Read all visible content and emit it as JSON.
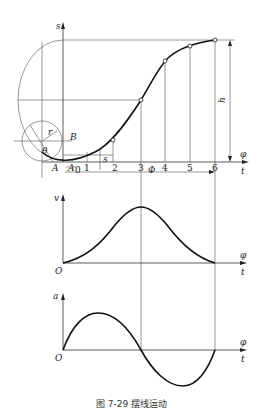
{
  "caption": "图 7-29   摆线运动",
  "labels": {
    "s_axis": "s",
    "v_axis": "v",
    "a_axis": "a",
    "phi": "φ",
    "t": "t",
    "h": "h",
    "r": "r",
    "theta": "θ",
    "A": "A",
    "A0": "A",
    "A0_sub": "0",
    "B": "B",
    "Phi": "Φ",
    "s_small": "s",
    "origin_v": "O",
    "origin_a": "O"
  },
  "ticks": [
    "1",
    "2",
    "3",
    "4",
    "5",
    "6"
  ],
  "panels": [
    {
      "name": "displacement",
      "curve": "cycloidal s(φ) rising from 0 to h"
    },
    {
      "name": "velocity",
      "curve": "bell-shaped v(φ), peak at 3"
    },
    {
      "name": "acceleration",
      "curve": "full sine a(φ), zero at 3 and 6"
    }
  ]
}
